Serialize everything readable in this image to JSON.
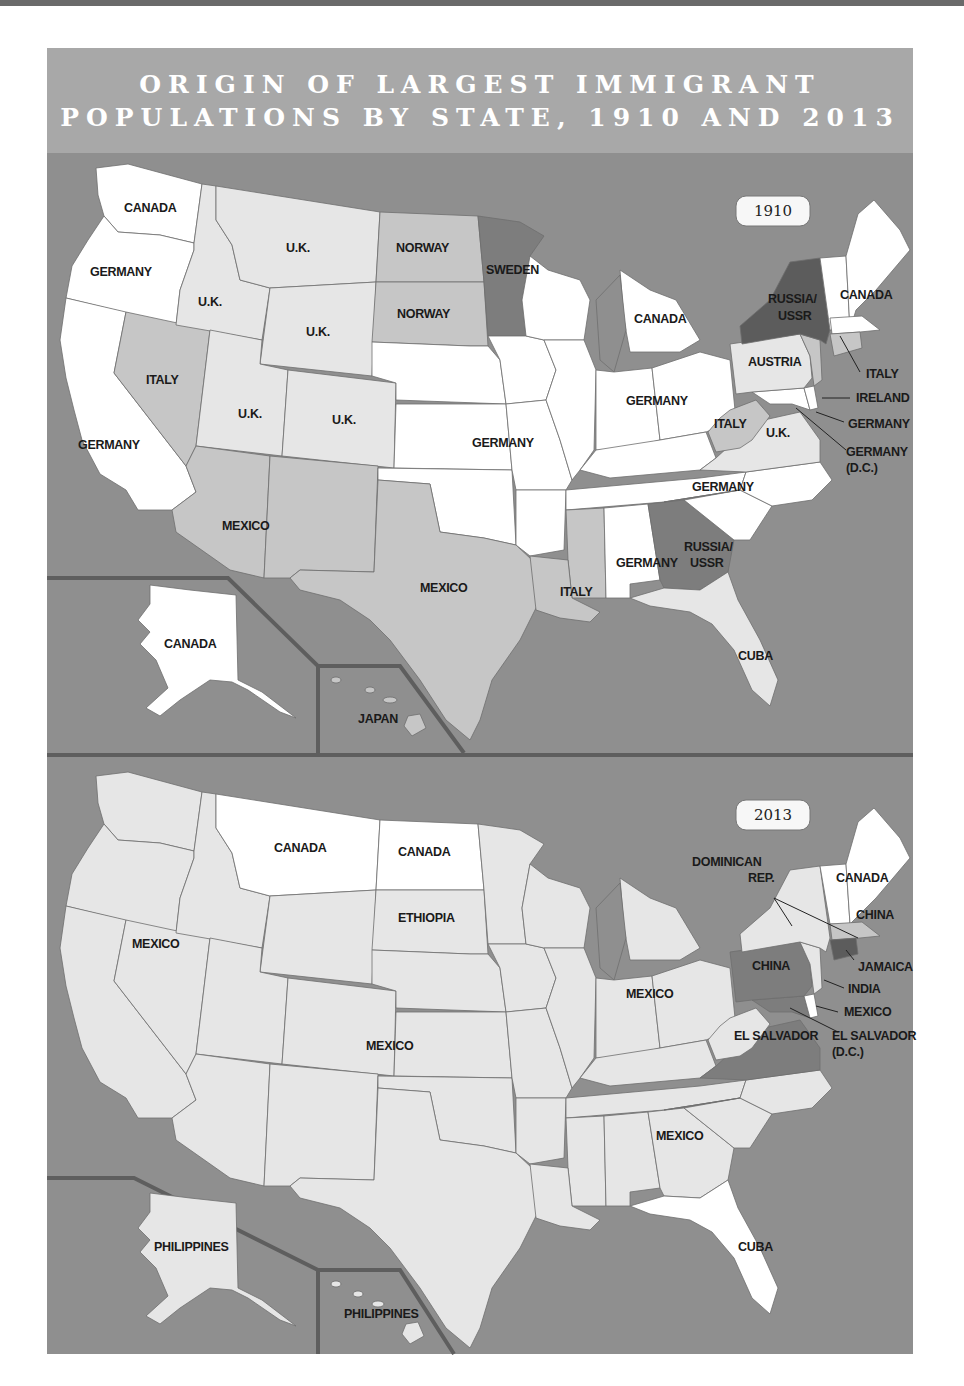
{
  "title": {
    "line1": "ORIGIN OF LARGEST IMMIGRANT",
    "line2": "POPULATIONS BY STATE, 1910 AND 2013"
  },
  "colors": {
    "water": "#8f8f8f",
    "title_band": "#a8a8a8",
    "white_category": "#ffffff",
    "light_category": "#e6e6e6",
    "medium_category": "#c4c4c4",
    "dark_category": "#7b7b7b",
    "darkest_category": "#5a5a5a",
    "inset_border": "#5e5e5e"
  },
  "map_1910": {
    "year_label": "1910",
    "labels": {
      "washington": "CANADA",
      "oregon": "GERMANY",
      "california": "GERMANY",
      "idaho": "U.K.",
      "montana": "U.K.",
      "wyoming": "U.K.",
      "utah": "U.K.",
      "colorado": "U.K.",
      "nevada": "ITALY",
      "north_dakota": "NORWAY",
      "south_dakota": "NORWAY",
      "minnesota": "SWEDEN",
      "michigan": "CANADA",
      "plains_midwest": "GERMANY",
      "indiana_ohio": "GERMANY",
      "new_york": "RUSSIA/\nUSSR",
      "new_york_l1": "RUSSIA/",
      "new_york_l2": "USSR",
      "new_england": "CANADA",
      "pennsylvania": "AUSTRIA",
      "rhode_island_connecticut": "ITALY",
      "new_jersey": "IRELAND",
      "delaware": "GERMANY",
      "dc_l1": "GERMANY",
      "dc_l2": "(D.C.)",
      "west_virginia": "ITALY",
      "virginia": "U.K.",
      "north_carolina": "GERMANY",
      "arizona_new_mexico": "MEXICO",
      "texas": "MEXICO",
      "louisiana_mississippi": "ITALY",
      "alabama": "GERMANY",
      "georgia_l1": "RUSSIA/",
      "georgia_l2": "USSR",
      "florida": "CUBA",
      "alaska": "CANADA",
      "hawaii": "JAPAN"
    }
  },
  "map_2013": {
    "year_label": "2013",
    "labels": {
      "montana": "CANADA",
      "north_dakota": "CANADA",
      "south_dakota": "ETHIOPIA",
      "west": "MEXICO",
      "central": "MEXICO",
      "midwest": "MEXICO",
      "southeast": "MEXICO",
      "new_york_l1": "DOMINICAN",
      "new_york_l2": "REP.",
      "new_england": "CANADA",
      "massachusetts": "CHINA",
      "pennsylvania": "CHINA",
      "connecticut": "JAMAICA",
      "new_jersey": "INDIA",
      "delaware": "MEXICO",
      "virginia_maryland": "EL SALVADOR",
      "dc_l1": "EL SALVADOR",
      "dc_l2": "(D.C.)",
      "florida": "CUBA",
      "alaska": "PHILIPPINES",
      "hawaii": "PHILIPPINES"
    }
  }
}
